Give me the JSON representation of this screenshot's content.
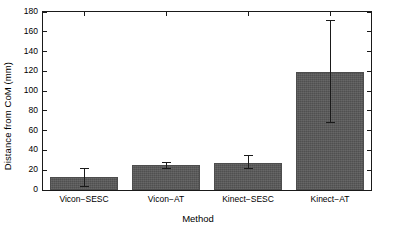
{
  "chart_data": {
    "type": "bar",
    "title": "",
    "xlabel": "Method",
    "ylabel": "Distance from CoM (mm)",
    "categories": [
      "Vicon−SESC",
      "Vicon−AT",
      "Kinect−SESC",
      "Kinect−AT"
    ],
    "values": [
      13,
      25,
      27.5,
      119.5
    ],
    "error_low": [
      3.5,
      21,
      21,
      67.5
    ],
    "error_high": [
      22,
      28,
      35,
      171.5
    ],
    "ylim": [
      0,
      180
    ],
    "yticks": [
      0,
      20,
      40,
      60,
      80,
      100,
      120,
      140,
      160,
      180
    ],
    "ytick_labels": [
      "0",
      "20",
      "40",
      "60",
      "80",
      "100",
      "120",
      "140",
      "160",
      "180"
    ],
    "grid": false,
    "legend": null,
    "bar_color": "#585858",
    "error_color": "#1a1a1a",
    "axis_color": "#1a1a1a",
    "background": "#ffffff"
  }
}
